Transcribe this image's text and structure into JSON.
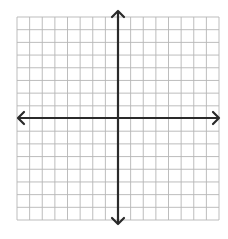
{
  "diagram": {
    "grid": {
      "cells_x": 16,
      "cells_y": 16,
      "left": 17,
      "top": 17,
      "right": 219,
      "bottom": 220,
      "line_color": "#b5b5b5",
      "background": "#ffffff"
    },
    "axes": {
      "x_axis_y": 118,
      "y_axis_x": 118,
      "x_start": 18,
      "x_end": 219,
      "y_start": 11,
      "y_end": 224,
      "color": "#2a2a2a",
      "arrows": [
        "left",
        "right",
        "up",
        "down"
      ]
    }
  }
}
